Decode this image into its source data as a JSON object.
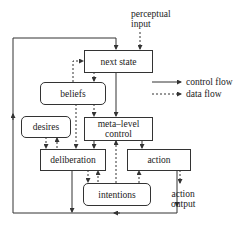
{
  "diagram": {
    "nodes": {
      "next_state": "next state",
      "beliefs": "beliefs",
      "desires": "desires",
      "meta_level_control": "meta–level control",
      "deliberation": "deliberation",
      "action": "action",
      "intentions": "intentions"
    },
    "io": {
      "perceptual_input_1": "perceptual",
      "perceptual_input_2": "input",
      "action_output_1": "action",
      "action_output_2": "output"
    },
    "legend": {
      "control_flow": "control flow",
      "data_flow": "data flow"
    },
    "colors": {
      "line": "#333333",
      "text": "#222222",
      "background": "#ffffff"
    }
  }
}
